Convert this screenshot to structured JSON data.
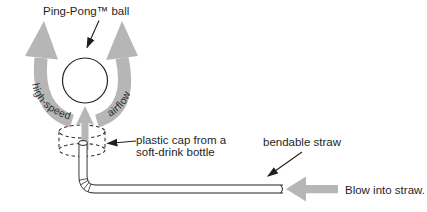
{
  "figure": {
    "title": "Ping-Pong™ ball",
    "airflow": {
      "left_label": "high-speed",
      "right_label": "airflow"
    },
    "cap_label_line1": "plastic cap from a",
    "cap_label_line2": "soft-drink bottle",
    "straw_label": "bendable straw",
    "blow_label": "Blow into straw.",
    "colors": {
      "arrow_gray": "#b6b6b6",
      "ink": "#1f1f1f",
      "background": "#ffffff"
    }
  }
}
